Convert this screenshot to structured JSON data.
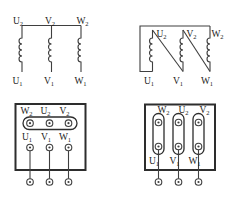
{
  "colors": {
    "background": "#ffffff",
    "line": "#3f3f3f",
    "frame": "#2d2d2d",
    "text": "#1c1c1c"
  },
  "figure": {
    "star_schematic": {
      "top_labels": [
        {
          "base": "U",
          "sub": "2"
        },
        {
          "base": "V",
          "sub": "2"
        },
        {
          "base": "W",
          "sub": "2"
        }
      ],
      "bottom_labels": [
        {
          "base": "U",
          "sub": "1"
        },
        {
          "base": "V",
          "sub": "1"
        },
        {
          "base": "W",
          "sub": "1"
        }
      ]
    },
    "delta_schematic": {
      "top_labels": [
        {
          "base": "U",
          "sub": "2"
        },
        {
          "base": "V",
          "sub": "2"
        },
        {
          "base": "W",
          "sub": "2"
        }
      ],
      "bottom_labels": [
        {
          "base": "U",
          "sub": "1"
        },
        {
          "base": "V",
          "sub": "1"
        },
        {
          "base": "W",
          "sub": "1"
        }
      ]
    },
    "star_terminal_box": {
      "top_labels": [
        {
          "base": "W",
          "sub": "2"
        },
        {
          "base": "U",
          "sub": "2"
        },
        {
          "base": "V",
          "sub": "2"
        }
      ],
      "middle_labels": [
        {
          "base": "U",
          "sub": "1"
        },
        {
          "base": "V",
          "sub": "1"
        },
        {
          "base": "W",
          "sub": "1"
        }
      ]
    },
    "delta_terminal_box": {
      "top_labels": [
        {
          "base": "W",
          "sub": "2"
        },
        {
          "base": "U",
          "sub": "2"
        },
        {
          "base": "V",
          "sub": "2"
        }
      ],
      "bottom_labels": [
        {
          "base": "U",
          "sub": "1"
        },
        {
          "base": "V",
          "sub": "1"
        },
        {
          "base": "W",
          "sub": "1"
        }
      ]
    }
  }
}
